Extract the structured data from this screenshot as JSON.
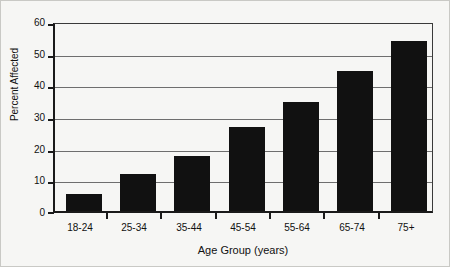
{
  "chart_data": {
    "type": "bar",
    "title": "",
    "subtitle": "",
    "categories": [
      "18-24",
      "25-34",
      "35-44",
      "45-54",
      "55-64",
      "65-74",
      "75+"
    ],
    "values": [
      5.5,
      12,
      17.5,
      27,
      35,
      45,
      54.5
    ],
    "series": [
      {
        "name": "Percent Affected",
        "values": [
          5.5,
          12,
          17.5,
          27,
          35,
          45,
          54.5
        ]
      }
    ],
    "xlabel": "Age Group (years)",
    "ylabel": "Percent Affected",
    "ylim": [
      0,
      60
    ],
    "yticks": [
      0,
      10,
      20,
      30,
      40,
      50,
      60
    ],
    "ytick_labels": [
      "0",
      "10",
      "20",
      "30",
      "40",
      "50",
      "60"
    ],
    "grid": true,
    "grid_axis": "y",
    "legend": false,
    "legend_position": "none",
    "bar_color": "#111111",
    "background_color": "#f6f6f4",
    "axis_color": "#1a1a1a",
    "gridline_color": "#6e6e6e"
  }
}
